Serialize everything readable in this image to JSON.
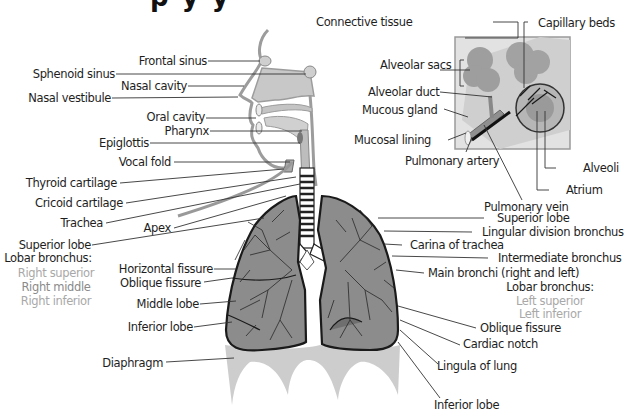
{
  "diagram": {
    "title_fragment": "p   y  y  ",
    "labels": {
      "frontal_sinus": "Frontal sinus",
      "sphenoid_sinus": "Sphenoid sinus",
      "nasal_cavity": "Nasal cavity",
      "nasal_vestibule": "Nasal vestibule",
      "oral_cavity": "Oral cavity",
      "pharynx": "Pharynx",
      "epiglottis": "Epiglottis",
      "vocal_fold": "Vocal fold",
      "thyroid_cartilage": "Thyroid cartilage",
      "cricoid_cartilage": "Cricoid cartilage",
      "trachea": "Trachea",
      "apex": "Apex",
      "superior_lobe_right": "Superior lobe",
      "lobar_bronchus_right_heading": "Lobar bronchus:",
      "right_superior": "Right superior",
      "right_middle": "Right middle",
      "right_inferior": "Right inferior",
      "horizontal_fissure": "Horizontal fissure",
      "oblique_fissure_right": "Oblique fissure",
      "middle_lobe": "Middle lobe",
      "inferior_lobe_right": "Inferior lobe",
      "diaphragm": "Diaphragm",
      "connective_tissue": "Connective tissue",
      "capillary_beds": "Capillary beds",
      "alveolar_sacs": "Alveolar sacs",
      "alveolar_duct": "Alveolar duct",
      "mucous_gland": "Mucous gland",
      "mucosal_lining": "Mucosal lining",
      "pulmonary_artery": "Pulmonary artery",
      "alveoli": "Alveoli",
      "atrium": "Atrium",
      "pulmonary_vein": "Pulmonary vein",
      "superior_lobe_left": "Superior lobe",
      "lingular_division_bronchus": "Lingular division bronchus",
      "carina_of_trachea": "Carina of trachea",
      "intermediate_bronchus": "Intermediate bronchus",
      "main_bronchi": "Main bronchi (right and left)",
      "lobar_bronchus_left_heading": "Lobar bronchus:",
      "left_superior": "Left superior",
      "left_inferior": "Left inferior",
      "oblique_fissure_left": "Oblique fissure",
      "cardiac_notch": "Cardiac notch",
      "lingula_of_lung": "Lingula of lung",
      "inferior_lobe_left": "Inferior lobe"
    },
    "colors": {
      "text": "#1e1e1e",
      "leader_line": "#333333",
      "tissue_grey": "#bdbdbd",
      "lung_fill": "#8c8c8c",
      "outline": "#1a1a1a",
      "bronchus_light_text": "#a8a8a8",
      "bronchus_mid_text": "#8a8a8a"
    }
  }
}
